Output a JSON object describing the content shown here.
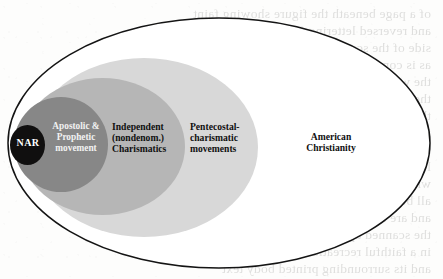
{
  "figure": {
    "name": "nested-euler-diagram",
    "canvas": {
      "width": 443,
      "height": 279
    },
    "background_color": "#fdfdfc"
  },
  "regions": [
    {
      "id": "american-christianity",
      "label": "American\nChristianity",
      "fill_color": "#ffffff",
      "stroke_color": "#141414",
      "text_color": "#101010",
      "level": 0
    },
    {
      "id": "pentecostal-charismatic-movements",
      "label": "Pentecostal-\ncharismatic\nmovements",
      "fill_color": "#d8d8d8",
      "stroke_color": "none",
      "text_color": "#101010",
      "level": 1
    },
    {
      "id": "independent-nondenom-charismatics",
      "label": "Independent\n(nondenom.)\nCharismatics",
      "fill_color": "#b6b6b6",
      "stroke_color": "none",
      "text_color": "#101010",
      "level": 2
    },
    {
      "id": "apostolic-prophetic-movement",
      "label": "Apostolic &\nProphetic\nmovement",
      "fill_color": "#878787",
      "stroke_color": "none",
      "text_color": "#f2f2f2",
      "level": 3
    },
    {
      "id": "nar",
      "label": "NAR",
      "fill_color": "#100f0f",
      "stroke_color": "none",
      "text_color": "#ffffff",
      "level": 4
    }
  ],
  "bleed_through_text": [
    "of a page beneath the figure showing faint",
    "and reversed lettering from the opposite",
    "side of the scanned sheet of the volume",
    "as is common in older printed editions of",
    "the work, where the ink has migrated to",
    "the verso and become partially visible",
    "through the thin paper stock used here",
    "in the original typesetting of this book",
    "so that the ghosted characters remain",
    "legible only as indistinct gray strokes",
    "which do not belong to the diagram at",
    "all but to the reverse of the printed leaf",
    "and are reproduced here for fidelity of",
    "the scanned appearance of the figure",
    "in a faithful recreation of the artifact",
    "and its surrounding printed body text"
  ]
}
